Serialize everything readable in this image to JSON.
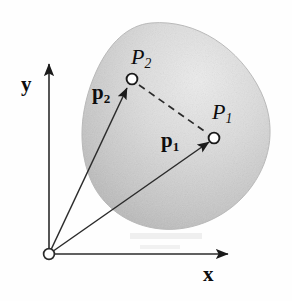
{
  "figure": {
    "kind": "vector-diagram",
    "background_color": "#fefefe",
    "ink_color": "#1a1a1a",
    "body_fill_light": "#e8e8e8",
    "body_fill_dark": "#b4b4b4"
  },
  "axes": {
    "origin": {
      "x": 49,
      "y": 254,
      "marker": "open-circle",
      "radius": 5.5
    },
    "y_axis": {
      "label": "y",
      "from_x": 49,
      "from_y": 254,
      "to_x": 49,
      "to_y": 62
    },
    "x_axis": {
      "label": "x",
      "from_x": 49,
      "from_y": 254,
      "to_x": 231,
      "to_y": 254
    }
  },
  "body": {
    "name": "rigid-body",
    "centroid_x": 176,
    "centroid_y": 126
  },
  "points": [
    {
      "id": "P1",
      "label": "P",
      "subscript": "1",
      "x": 214,
      "y": 138,
      "marker": "open-circle",
      "radius": 5.5
    },
    {
      "id": "P2",
      "label": "P",
      "subscript": "2",
      "x": 132,
      "y": 79,
      "marker": "open-circle",
      "radius": 5.5
    }
  ],
  "vectors": [
    {
      "id": "p1",
      "label": "p",
      "subscript": "1",
      "bold": true,
      "from_x": 49,
      "from_y": 254,
      "to_x": 211,
      "to_y": 141,
      "style": "solid",
      "arrowhead": true
    },
    {
      "id": "p2",
      "label": "p",
      "subscript": "2",
      "bold": true,
      "from_x": 49,
      "from_y": 254,
      "to_x": 128,
      "to_y": 86,
      "style": "solid",
      "arrowhead": true
    }
  ],
  "connectors": [
    {
      "id": "P2-P1-dashed",
      "from_x": 138,
      "from_y": 84,
      "to_x": 209,
      "to_y": 134,
      "style": "dashed",
      "dash_pattern": "7 5"
    }
  ]
}
